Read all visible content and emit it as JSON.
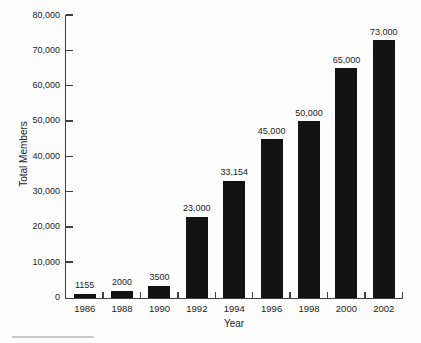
{
  "chart_data": {
    "type": "bar",
    "title": "",
    "xlabel": "Year",
    "ylabel": "Total Members",
    "categories": [
      "1986",
      "1988",
      "1990",
      "1992",
      "1994",
      "1996",
      "1998",
      "2000",
      "2002"
    ],
    "values": [
      1155,
      2000,
      3500,
      23000,
      33154,
      45000,
      50000,
      65000,
      73000
    ],
    "value_labels": [
      "1155",
      "2000",
      "3500",
      "23,000",
      "33,154",
      "45,000",
      "50,000",
      "65,000",
      "73,000"
    ],
    "ylim": [
      0,
      80000
    ],
    "y_tick_step": 10000,
    "y_tick_labels": [
      "0",
      "10,000",
      "20,000",
      "30,000",
      "40,000",
      "50,000",
      "60,000",
      "70,000",
      "80,000"
    ],
    "grid": false,
    "legend": "none",
    "bar_color": "#121212",
    "axis_color": "#3f3f3f",
    "text_color": "#1c1c1c",
    "background_color": "#fdfdfd"
  }
}
